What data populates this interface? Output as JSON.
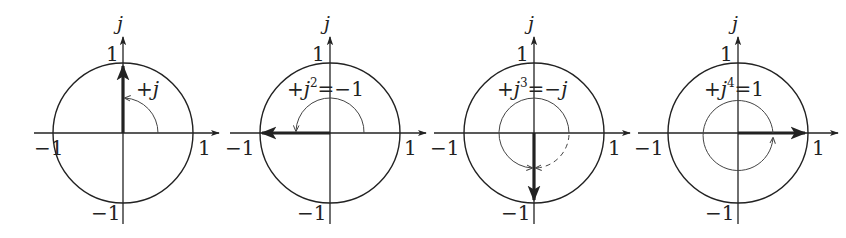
{
  "figure": {
    "axis_name": "j",
    "tick_labels": {
      "pos_real": "1",
      "neg_real": "−1",
      "pos_imag": "1",
      "neg_imag": "−1"
    },
    "colors": {
      "ink": "#222222",
      "thin_ink": "#444444",
      "background": "#ffffff"
    },
    "panels": [
      {
        "id": "j1",
        "label_prefix": "+",
        "label_base": "j",
        "label_power": "",
        "label_rhs": "",
        "rotation_deg": 90,
        "result": "+j",
        "vector_direction": "up"
      },
      {
        "id": "j2",
        "label_prefix": "+",
        "label_base": "j",
        "label_power": "2",
        "label_rhs": "=−1",
        "rotation_deg": 180,
        "result": "-1",
        "vector_direction": "left"
      },
      {
        "id": "j3",
        "label_prefix": "+",
        "label_base": "j",
        "label_power": "3",
        "label_rhs_eq": "=−",
        "label_rhs_var": "j",
        "rotation_deg": 270,
        "result": "-j",
        "vector_direction": "down"
      },
      {
        "id": "j4",
        "label_prefix": "+",
        "label_base": "j",
        "label_power": "4",
        "label_rhs": "=1",
        "rotation_deg": 360,
        "result": "1",
        "vector_direction": "right"
      }
    ]
  }
}
